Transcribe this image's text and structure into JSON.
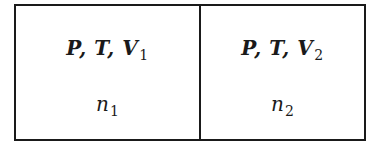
{
  "diagram": {
    "type": "two-compartment gas container",
    "compartments": [
      {
        "label_vars": "P, T, V",
        "volume_subscript": "1",
        "moles_symbol": "n",
        "moles_subscript": "1"
      },
      {
        "label_vars": "P, T, V",
        "volume_subscript": "2",
        "moles_symbol": "n",
        "moles_subscript": "2"
      }
    ],
    "colors": {
      "stroke": "#1a1a1a",
      "background": "#ffffff"
    }
  }
}
